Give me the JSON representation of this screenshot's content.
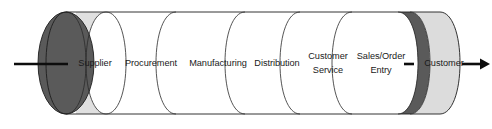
{
  "diagram": {
    "type": "cylinder-pipeline-flow",
    "orientation": "horizontal",
    "background_color": "#ffffff",
    "outline_color": "#1d1d1d",
    "segments": [
      {
        "id": "end-cap-left",
        "label": "",
        "fill": "#5a5a5a",
        "kind": "end-cap",
        "lines": []
      },
      {
        "id": "supplier",
        "label": "Supplier",
        "fill": "#e0e0e0",
        "kind": "stage",
        "lines": [
          "Supplier"
        ]
      },
      {
        "id": "procurement",
        "label": "Procurement",
        "fill": "#ffffff",
        "kind": "stage",
        "lines": [
          "Procurement"
        ]
      },
      {
        "id": "manufacturing",
        "label": "Manufacturing",
        "fill": "#ffffff",
        "kind": "stage",
        "lines": [
          "Manufacturing"
        ]
      },
      {
        "id": "distribution",
        "label": "Distribution",
        "fill": "#ffffff",
        "kind": "stage",
        "lines": [
          "Distribution"
        ]
      },
      {
        "id": "customer-service",
        "label": "Customer Service",
        "fill": "#ffffff",
        "kind": "stage",
        "lines": [
          "Customer",
          "Service"
        ]
      },
      {
        "id": "sales-order-entry",
        "label": "Sales/Order Entry",
        "fill": "#ffffff",
        "kind": "stage",
        "lines": [
          "Sales/Order",
          "Entry"
        ]
      },
      {
        "id": "divider-dark",
        "label": "",
        "fill": "#5a5a5a",
        "kind": "divider-band",
        "lines": []
      },
      {
        "id": "customer",
        "label": "Customer",
        "fill": "#dcdcdc",
        "kind": "stage",
        "lines": [
          "Customer"
        ]
      }
    ],
    "labels": {
      "supplier": "Supplier",
      "procurement": "Procurement",
      "manufacturing": "Manufacturing",
      "distribution": "Distribution",
      "customer_service_line1": "Customer",
      "customer_service_line2": "Service",
      "sales_order_line1": "Sales/Order",
      "sales_order_line2": "Entry",
      "customer": "Customer"
    },
    "arrows": {
      "input": {
        "id": "input-arrow",
        "direction": "right",
        "description": "inbound flow into supplier end cap"
      },
      "output": {
        "id": "output-arrow",
        "direction": "right",
        "description": "outbound flow to customer"
      },
      "internal_tick": {
        "id": "internal-tick",
        "direction": "right",
        "description": "small tick between sales/order entry and customer"
      }
    },
    "colors": {
      "dark_gray": "#5a5a5a",
      "light_gray": "#e0e0e0",
      "customer_gray": "#dcdcdc",
      "white": "#ffffff",
      "outline": "#1d1d1d",
      "text": "#1a1a1a",
      "arrow": "#0d0d0d"
    }
  }
}
